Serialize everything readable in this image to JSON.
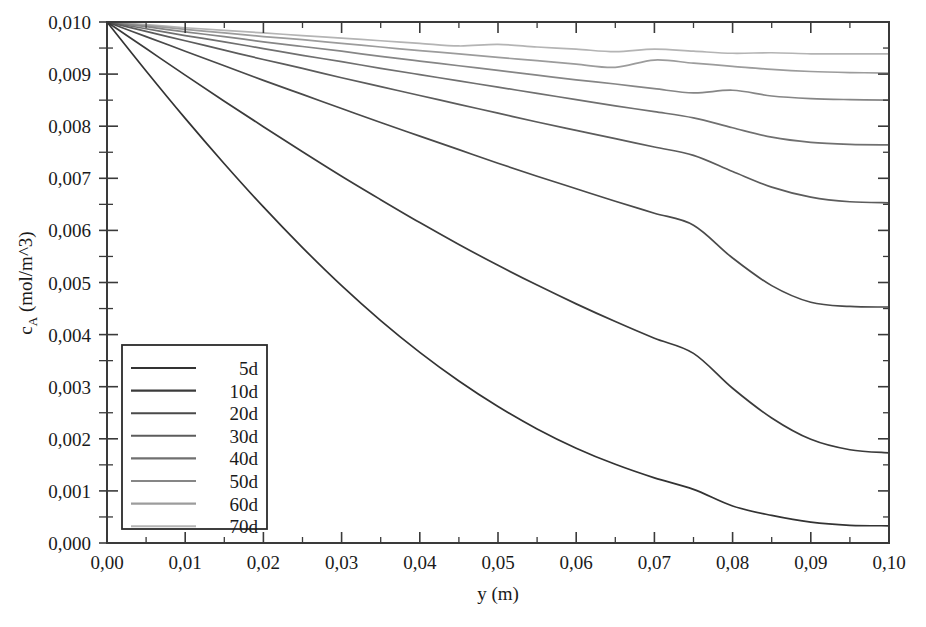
{
  "chart_data": {
    "type": "line",
    "title": "",
    "xlabel": "y (m)",
    "ylabel": "c_A (mol/m^3)",
    "ylabel_base": "c",
    "ylabel_sub": "A",
    "ylabel_rest": " (mol/m^3)",
    "xlim": [
      0.0,
      0.1
    ],
    "ylim": [
      0.0,
      0.01
    ],
    "grid": false,
    "decimal_separator": ",",
    "legend_position": "lower-left-inside",
    "xticks": [
      0.0,
      0.01,
      0.02,
      0.03,
      0.04,
      0.05,
      0.06,
      0.07,
      0.08,
      0.09,
      0.1
    ],
    "xticklabels": [
      "0,00",
      "0,01",
      "0,02",
      "0,03",
      "0,04",
      "0,05",
      "0,06",
      "0,07",
      "0,08",
      "0,09",
      "0,10"
    ],
    "xminorticks": [
      0.005,
      0.015,
      0.025,
      0.035,
      0.045,
      0.055,
      0.065,
      0.075,
      0.085,
      0.095
    ],
    "yticks": [
      0.0,
      0.001,
      0.002,
      0.003,
      0.004,
      0.005,
      0.006,
      0.007,
      0.008,
      0.009,
      0.01
    ],
    "yticklabels": [
      "0,000",
      "0,001",
      "0,002",
      "0,003",
      "0,004",
      "0,005",
      "0,006",
      "0,007",
      "0,008",
      "0,009",
      "0,010"
    ],
    "yminorticks": [
      0.0005,
      0.0015,
      0.0025,
      0.0035,
      0.0045,
      0.0055,
      0.0065,
      0.0075,
      0.0085,
      0.0095
    ],
    "x": [
      0.0,
      0.005,
      0.01,
      0.015,
      0.02,
      0.025,
      0.03,
      0.035,
      0.04,
      0.045,
      0.05,
      0.055,
      0.06,
      0.065,
      0.07,
      0.075,
      0.08,
      0.085,
      0.09,
      0.095,
      0.1
    ],
    "series": [
      {
        "name": "5d",
        "color": "#333333",
        "values": [
          0.01,
          0.00906,
          0.00815,
          0.00728,
          0.00645,
          0.00567,
          0.00494,
          0.00427,
          0.00366,
          0.00311,
          0.00262,
          0.00219,
          0.00182,
          0.00151,
          0.00125,
          0.00103,
          0.00071,
          0.00053,
          0.0004,
          0.00034,
          0.00033
        ]
      },
      {
        "name": "10d",
        "color": "#3b3b3b",
        "values": [
          0.01,
          0.00949,
          0.00898,
          0.00848,
          0.00799,
          0.00751,
          0.00704,
          0.00659,
          0.00615,
          0.00573,
          0.00533,
          0.00495,
          0.00459,
          0.00425,
          0.00393,
          0.00364,
          0.00297,
          0.0024,
          0.00199,
          0.00179,
          0.00173
        ]
      },
      {
        "name": "20d",
        "color": "#4a4a4a",
        "values": [
          0.01,
          0.00972,
          0.00944,
          0.00916,
          0.00888,
          0.00861,
          0.00834,
          0.00807,
          0.00781,
          0.00755,
          0.00729,
          0.00704,
          0.0068,
          0.00656,
          0.00633,
          0.0061,
          0.00547,
          0.00494,
          0.00462,
          0.00454,
          0.00453
        ]
      },
      {
        "name": "30d",
        "color": "#5c5c5c",
        "values": [
          0.01,
          0.00982,
          0.00964,
          0.00946,
          0.00928,
          0.00911,
          0.00893,
          0.00876,
          0.00859,
          0.00842,
          0.00825,
          0.00808,
          0.00792,
          0.00776,
          0.0076,
          0.00744,
          0.00713,
          0.00683,
          0.00664,
          0.00655,
          0.00653
        ]
      },
      {
        "name": "40d",
        "color": "#707070",
        "values": [
          0.01,
          0.00987,
          0.00974,
          0.00962,
          0.00949,
          0.00936,
          0.00924,
          0.00911,
          0.00899,
          0.00887,
          0.00875,
          0.00863,
          0.00851,
          0.00839,
          0.00828,
          0.00816,
          0.00797,
          0.00779,
          0.00769,
          0.00765,
          0.00764
        ]
      },
      {
        "name": "50d",
        "color": "#868686",
        "values": [
          0.01,
          0.00991,
          0.00981,
          0.00972,
          0.00962,
          0.00953,
          0.00944,
          0.00934,
          0.00925,
          0.00916,
          0.00907,
          0.00898,
          0.00889,
          0.00881,
          0.00872,
          0.00864,
          0.00869,
          0.00858,
          0.00853,
          0.00851,
          0.0085
        ]
      },
      {
        "name": "60d",
        "color": "#9c9c9c",
        "values": [
          0.01,
          0.00993,
          0.00986,
          0.00979,
          0.00972,
          0.00966,
          0.00959,
          0.00952,
          0.00945,
          0.00939,
          0.00932,
          0.00926,
          0.00919,
          0.00913,
          0.00927,
          0.00921,
          0.00915,
          0.00909,
          0.00905,
          0.00903,
          0.00902
        ]
      },
      {
        "name": "70d",
        "color": "#b4b4b4",
        "values": [
          0.01,
          0.00995,
          0.00989,
          0.00984,
          0.00979,
          0.00974,
          0.00969,
          0.00964,
          0.00959,
          0.00954,
          0.00957,
          0.00952,
          0.00948,
          0.00943,
          0.00948,
          0.00944,
          0.0094,
          0.00941,
          0.00939,
          0.00939,
          0.00939
        ]
      }
    ]
  },
  "legend": {
    "entries": [
      "5d",
      "10d",
      "20d",
      "30d",
      "40d",
      "50d",
      "60d",
      "70d"
    ]
  }
}
